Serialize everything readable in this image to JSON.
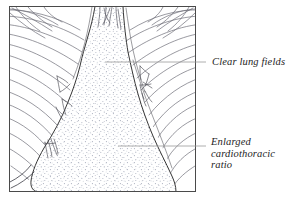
{
  "figure": {
    "type": "medical-illustration",
    "frame": {
      "x": 9,
      "y": 6,
      "width": 187,
      "height": 186
    },
    "colors": {
      "background": "#ffffff",
      "frame_border": "#4a4a4a",
      "rib_line": "#6e6e78",
      "cardiac_outline": "#2b2b2b",
      "stipple": "#9aa0b0",
      "leader_line": "#9a9a9a",
      "label_text": "#1d1d1d"
    }
  },
  "labels": [
    {
      "id": "clear-lung-fields",
      "text": "Clear lung fields",
      "lines": [
        "Clear lung fields"
      ],
      "leader": {
        "x1": 105,
        "y1": 62,
        "x2": 206,
        "y2": 62
      }
    },
    {
      "id": "enlarged-cardiothoracic-ratio",
      "text": "Enlarged cardiothoracic ratio",
      "lines": [
        "Enlarged",
        "cardiothoracic",
        "ratio"
      ],
      "leader": {
        "x1": 118,
        "y1": 146,
        "x2": 206,
        "y2": 146
      }
    }
  ]
}
